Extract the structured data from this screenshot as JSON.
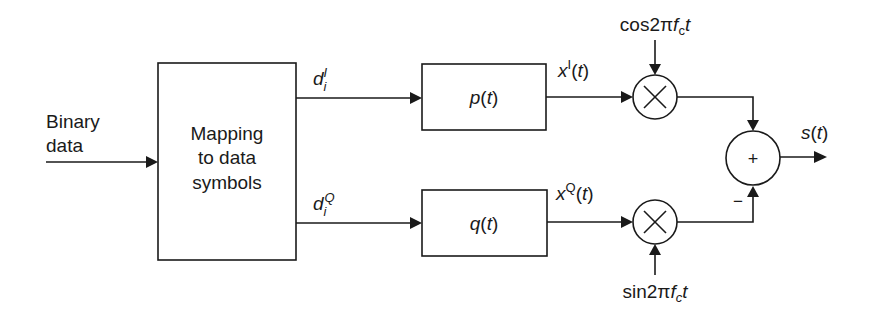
{
  "diagram": {
    "type": "block-diagram",
    "input": {
      "line1": "Binary",
      "line2": "data"
    },
    "mapper": {
      "line1": "Mapping",
      "line2": "to data",
      "line3": "symbols"
    },
    "branch_i": {
      "symbol": "d",
      "subscript": "i",
      "superscript": "I",
      "filter": {
        "name": "p",
        "arg": "(",
        "var": "t",
        "close": ")"
      },
      "output": {
        "name": "x",
        "superscript": "I",
        "open": "(",
        "var": "t",
        "close": ")"
      },
      "carrier": {
        "func": "cos2π",
        "f": "f",
        "sub": "c",
        "t": "t"
      }
    },
    "branch_q": {
      "symbol": "d",
      "subscript": "i",
      "superscript": "Q",
      "filter": {
        "name": "q",
        "arg": "(",
        "var": "t",
        "close": ")"
      },
      "output": {
        "name": "x",
        "superscript": "Q",
        "open": "(",
        "var": "t",
        "close": ")"
      },
      "carrier": {
        "func": "sin2π",
        "f": "f",
        "sub": "c",
        "t": "t"
      }
    },
    "multiplier_symbol": "×",
    "summer": {
      "symbol": "+",
      "minus_sign": "−"
    },
    "output": {
      "name": "s",
      "open": "(",
      "var": "t",
      "close": ")"
    },
    "colors": {
      "stroke": "#1a1a1a",
      "background": "#ffffff"
    }
  }
}
